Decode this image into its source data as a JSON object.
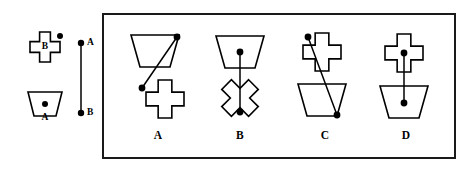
{
  "figure": {
    "type": "spatial-reasoning-multiple-choice",
    "title_text": "",
    "background_color": "#ffffff",
    "ink_color": "#000000",
    "frame": {
      "x": 103,
      "y": 14,
      "width": 352,
      "height": 144,
      "stroke_color": "#1a1a1a",
      "stroke_width": 2
    }
  },
  "reference": {
    "shapes": [
      {
        "id": "ref-shape-b",
        "name": "cross",
        "label": "B",
        "label_x": 45,
        "label_y": 47,
        "dot": {
          "x": 60,
          "y": 36,
          "r": 3
        },
        "center": {
          "x": 45,
          "y": 47
        },
        "rotation_deg": 0
      },
      {
        "id": "ref-shape-a",
        "name": "trapezoid-inverted",
        "label": "A",
        "label_x": 45,
        "label_y": 112,
        "dot": {
          "x": 45,
          "y": 104,
          "r": 3
        },
        "center": {
          "x": 45,
          "y": 104
        },
        "rotation_deg": 0
      }
    ],
    "axis": {
      "id": "reference-axis",
      "top_label": "A",
      "bottom_label": "B",
      "top_point": {
        "x": 81,
        "y": 43
      },
      "bottom_point": {
        "x": 81,
        "y": 113
      },
      "top_label_pos": {
        "x": 87,
        "y": 43
      },
      "bottom_label_pos": {
        "x": 87,
        "y": 113
      }
    }
  },
  "options": [
    {
      "id": "option-a",
      "label": "A",
      "label_x": 158,
      "label_y": 136,
      "top_shape": {
        "name": "trapezoid-inverted",
        "center": {
          "x": 155,
          "y": 51
        },
        "rotation_deg": 0
      },
      "bottom_shape": {
        "name": "cross",
        "center": {
          "x": 165,
          "y": 99
        },
        "rotation_deg": 0
      },
      "connector": {
        "from": {
          "x": 177,
          "y": 37
        },
        "to": {
          "x": 142,
          "y": 88
        }
      },
      "dots": [
        {
          "x": 177,
          "y": 37,
          "r": 3.4
        },
        {
          "x": 142,
          "y": 88,
          "r": 3.4
        }
      ]
    },
    {
      "id": "option-b",
      "label": "B",
      "label_x": 240,
      "label_y": 136,
      "top_shape": {
        "name": "trapezoid-inverted",
        "center": {
          "x": 240,
          "y": 52
        },
        "rotation_deg": 0
      },
      "bottom_shape": {
        "name": "cross",
        "center": {
          "x": 240,
          "y": 98
        },
        "rotation_deg": 45
      },
      "connector": {
        "from": {
          "x": 240,
          "y": 52
        },
        "to": {
          "x": 240,
          "y": 112
        }
      },
      "dots": [
        {
          "x": 240,
          "y": 52,
          "r": 3.4
        },
        {
          "x": 240,
          "y": 112,
          "r": 3.4
        }
      ]
    },
    {
      "id": "option-c",
      "label": "C",
      "label_x": 325,
      "label_y": 136,
      "top_shape": {
        "name": "cross",
        "center": {
          "x": 322,
          "y": 52
        },
        "rotation_deg": 0
      },
      "bottom_shape": {
        "name": "trapezoid-inverted",
        "center": {
          "x": 322,
          "y": 100
        },
        "rotation_deg": 0
      },
      "connector": {
        "from": {
          "x": 308,
          "y": 37
        },
        "to": {
          "x": 337,
          "y": 115
        }
      },
      "dots": [
        {
          "x": 308,
          "y": 37,
          "r": 3.4
        },
        {
          "x": 337,
          "y": 115,
          "r": 3.4
        }
      ]
    },
    {
      "id": "option-d",
      "label": "D",
      "label_x": 406,
      "label_y": 136,
      "top_shape": {
        "name": "cross",
        "center": {
          "x": 404,
          "y": 53
        },
        "rotation_deg": 0
      },
      "bottom_shape": {
        "name": "trapezoid-inverted",
        "center": {
          "x": 404,
          "y": 102
        },
        "rotation_deg": 0
      },
      "connector": {
        "from": {
          "x": 404,
          "y": 53
        },
        "to": {
          "x": 404,
          "y": 103
        }
      },
      "dots": [
        {
          "x": 404,
          "y": 53,
          "r": 3.4
        },
        {
          "x": 404,
          "y": 103,
          "r": 3.4
        }
      ]
    }
  ]
}
